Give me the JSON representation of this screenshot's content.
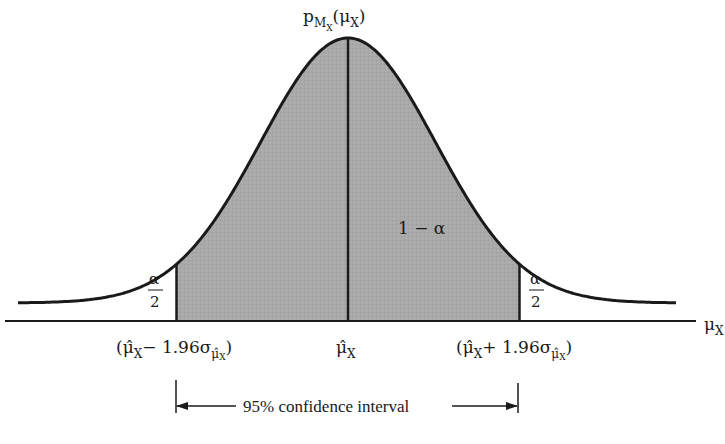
{
  "diagram": {
    "type": "normal-distribution-confidence-interval",
    "colors": {
      "shade": "#a9a9a9",
      "stroke": "#1a1a1a",
      "background": "#ffffff"
    },
    "labels": {
      "density": {
        "base": "p",
        "sub": "M",
        "subsub": "X",
        "arg_open": "(",
        "arg": "μ",
        "arg_sub": "X",
        "arg_close": ")"
      },
      "x_axis": {
        "base": "μ",
        "sub": "X"
      },
      "center": {
        "base": "μ̂",
        "sub": "X"
      },
      "lower_bound": {
        "open": "(",
        "base": "μ̂",
        "sub": "X",
        "op": "− 1.96σ",
        "sigma_sub": "μ̂",
        "sigma_subsub": "X",
        "close": ")"
      },
      "upper_bound": {
        "open": "(",
        "base": "μ̂",
        "sub": "X",
        "op": "+ 1.96σ",
        "sigma_sub": "μ̂",
        "sigma_subsub": "X",
        "close": ")"
      },
      "central_area": "1 − α",
      "left_tail_num": "α",
      "left_tail_den": "2",
      "right_tail_num": "α",
      "right_tail_den": "2",
      "interval_caption": "95% confidence interval"
    },
    "distribution": {
      "mean": 0,
      "std": 1,
      "lower_z": -1.96,
      "upper_z": 1.96,
      "confidence": 0.95
    }
  }
}
